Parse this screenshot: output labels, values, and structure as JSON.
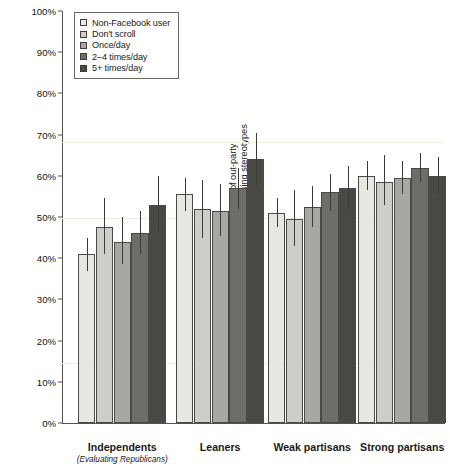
{
  "chart_data": {
    "type": "bar",
    "title": "",
    "xlabel": "",
    "ylabel": "Mean estimate of percent of out-party adhering to information-processing stereotypes",
    "ylabel_line1": "Mean estimate of percent of out-party",
    "ylabel_line2": "adhering to information-processing stereotypes",
    "ylim": [
      0,
      100
    ],
    "yticks": [
      "0%",
      "10%",
      "20%",
      "30%",
      "40%",
      "50%",
      "60%",
      "70%",
      "80%",
      "90%",
      "100%"
    ],
    "ytick_values": [
      0,
      10,
      20,
      30,
      40,
      50,
      60,
      70,
      80,
      90,
      100
    ],
    "grid": false,
    "legend_position": "top-left",
    "categories": [
      "Independents",
      "Leaners",
      "Weak partisans",
      "Strong partisans"
    ],
    "category_sublabels": [
      "(Evaluating Republicans)",
      "",
      "",
      ""
    ],
    "series": [
      {
        "name": "Non-Facebook user",
        "color": "#e9e7e1",
        "values": [
          41.0,
          55.5,
          51.0,
          60.0
        ],
        "err_low": [
          37.0,
          51.5,
          47.5,
          56.5
        ],
        "err_high": [
          45.0,
          59.5,
          54.5,
          63.5
        ]
      },
      {
        "name": "Don't scroll",
        "color": "#cfcdc8",
        "values": [
          47.5,
          52.0,
          49.5,
          58.5
        ],
        "err_low": [
          41.0,
          45.0,
          43.0,
          53.0
        ],
        "err_high": [
          54.5,
          59.0,
          56.5,
          65.0
        ]
      },
      {
        "name": "Once/day",
        "color": "#a9a7a2",
        "values": [
          44.0,
          51.5,
          52.5,
          59.5
        ],
        "err_low": [
          38.5,
          45.5,
          47.5,
          55.5
        ],
        "err_high": [
          50.0,
          58.0,
          57.5,
          63.5
        ]
      },
      {
        "name": "2–4 times/day",
        "color": "#6f6d69",
        "values": [
          46.0,
          57.0,
          56.0,
          62.0
        ],
        "err_low": [
          41.0,
          52.0,
          51.5,
          58.5
        ],
        "err_high": [
          51.5,
          62.0,
          60.5,
          65.5
        ]
      },
      {
        "name": "5+ times/day",
        "color": "#4a4844",
        "values": [
          53.0,
          64.0,
          57.0,
          60.0
        ],
        "err_low": [
          46.5,
          57.5,
          52.0,
          55.5
        ],
        "err_high": [
          60.0,
          70.5,
          62.5,
          64.5
        ]
      }
    ]
  },
  "axis": {
    "axis_color": "#55524e"
  }
}
